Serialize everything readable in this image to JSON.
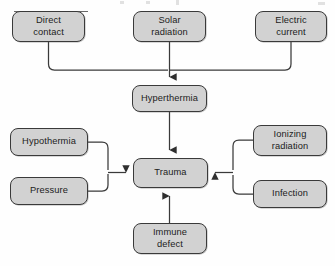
{
  "diagram": {
    "box_fill": "#d2d2d2",
    "box_border": "#3a3a3a",
    "line_color": "#3a3a3a",
    "text_color": "#1c1c1c",
    "background": "#fefefe",
    "nodes": [
      {
        "id": "direct-contact",
        "label": "Direct\ncontact",
        "x": 12,
        "y": 11,
        "w": 73,
        "h": 31
      },
      {
        "id": "solar-radiation",
        "label": "Solar\nradiation",
        "x": 133,
        "y": 11,
        "w": 73,
        "h": 31
      },
      {
        "id": "electric-current",
        "label": "Electric\ncurrent",
        "x": 255,
        "y": 11,
        "w": 72,
        "h": 31
      },
      {
        "id": "hyperthermia",
        "label": "Hyperthermia",
        "x": 132,
        "y": 85,
        "w": 75,
        "h": 27
      },
      {
        "id": "hypothermia",
        "label": "Hypothermia",
        "x": 10,
        "y": 128,
        "w": 78,
        "h": 28
      },
      {
        "id": "pressure",
        "label": "Pressure",
        "x": 10,
        "y": 177,
        "w": 78,
        "h": 28
      },
      {
        "id": "trauma",
        "label": "Trauma",
        "x": 133,
        "y": 158,
        "w": 75,
        "h": 30
      },
      {
        "id": "ionizing-radiation",
        "label": "Ionizing\nradiation",
        "x": 253,
        "y": 125,
        "w": 74,
        "h": 31
      },
      {
        "id": "infection",
        "label": "Infection",
        "x": 253,
        "y": 180,
        "w": 74,
        "h": 28
      },
      {
        "id": "immune-defect",
        "label": "Immune\ndefect",
        "x": 133,
        "y": 223,
        "w": 74,
        "h": 31
      }
    ],
    "edges": [
      {
        "id": "direct-contact-to-bus",
        "from": "direct-contact",
        "to": "hyperthermia",
        "arrow": false
      },
      {
        "id": "solar-radiation-to-bus",
        "from": "solar-radiation",
        "to": "hyperthermia",
        "arrow": true
      },
      {
        "id": "electric-current-to-bus",
        "from": "electric-current",
        "to": "hyperthermia",
        "arrow": false
      },
      {
        "id": "hyperthermia-to-trauma",
        "from": "hyperthermia",
        "to": "trauma",
        "arrow": true
      },
      {
        "id": "hypothermia-to-trauma",
        "from": "hypothermia",
        "to": "trauma",
        "arrow": true
      },
      {
        "id": "pressure-to-trauma",
        "from": "pressure",
        "to": "trauma",
        "arrow": true
      },
      {
        "id": "ionizing-radiation-to-trauma",
        "from": "ionizing-radiation",
        "to": "trauma",
        "arrow": true
      },
      {
        "id": "infection-to-trauma",
        "from": "infection",
        "to": "trauma",
        "arrow": true
      },
      {
        "id": "immune-defect-to-trauma",
        "from": "immune-defect",
        "to": "trauma",
        "arrow": true
      }
    ]
  }
}
